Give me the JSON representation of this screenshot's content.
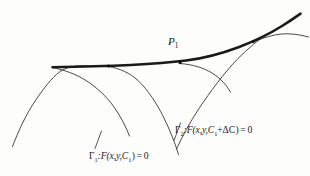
{
  "figure": {
    "background_color": "#fdfdfc",
    "ink_color": "#1a1a1a",
    "width": 310,
    "height": 176
  },
  "labels": {
    "point_p1": "P₁",
    "point_p1_base": "P",
    "point_p1_sub": "1",
    "gamma1": "Γ₁:F(x,y,C₁) = 0",
    "gamma1_name": "Γ",
    "gamma1_sub": "1",
    "gamma1_expr": ":F(x,y,C",
    "gamma1_param_sub": "1",
    "gamma1_tail": ") = 0",
    "gamma2_name": "Γ",
    "gamma2_sub": "2",
    "gamma2_expr": ":F(x,y,C",
    "gamma2_param_sub": "1",
    "gamma2_delta": "+ΔC",
    "gamma2_tail": ") = 0",
    "gamma2": "Γ₂:F(x,y,C₁+ΔC) = 0"
  },
  "geometry": {
    "envelope": {
      "name": "envelope-curve",
      "stroke_width": 2.6,
      "path": "M 52.5 67.2 C 96 66.6 150 65.0 186 60.5 C 222 56.0 258 41.0 282 26.0 C 291 20.4 296 16.8 300.5 13.6"
    },
    "family_curves": [
      {
        "name": "family-curve-left",
        "path": "M 12.5 146.5 C 18 132 26 114 36.5 99 C 44 88.2 51 78.5 59.5 72.0 C 66 67.0 76 65.0 88 66.0"
      },
      {
        "name": "gamma1-curve",
        "path": "M 108.5 66.5 C 120 68.5 130 73 138 80.5 C 148 90 157 104 163 116 C 170 130 175 143 178.5 154.5"
      },
      {
        "name": "family-curve-mid-left",
        "path": "M 52.5 67.5 C 64 70.0 76 74.0 86 80.5 C 97 87.5 107 97 114 107 C 121 117 126 127 129.5 136.0"
      },
      {
        "name": "gamma2-curve",
        "path": "M 176.5 149.0 C 182 137 190 122 199 108.5 C 210 92 224 73 238 58.5 C 248 48.5 258 40.0 268 33.5"
      },
      {
        "name": "family-curve-arc-p1",
        "path": "M 180.0 63.5 C 193 64.5 204 68.0 212 73.0 C 221 78.5 227 86 230.5 92.0"
      },
      {
        "name": "family-curve-right",
        "path": "M 253.5 42.0 C 266 36.5 278 33.5 288 33.8 C 296 34.1 303 35.5 308.5 37.0"
      }
    ],
    "tangent_points": [
      {
        "name": "tangent-point-left",
        "x": 108.5,
        "y": 66.0,
        "r": 1.5
      },
      {
        "name": "tangent-point-p1",
        "x": 180.0,
        "y": 62.6,
        "r": 1.6
      },
      {
        "name": "tangent-point-right",
        "x": 253.2,
        "y": 41.6,
        "r": 1.5
      }
    ],
    "leader_lines": [
      {
        "name": "leader-line-gamma1",
        "x1": 101.5,
        "y1": 131.0,
        "x2": 95.0,
        "y2": 148.5
      },
      {
        "name": "leader-line-gamma2",
        "x1": 180.5,
        "y1": 123.0,
        "x2": 174.0,
        "y2": 140.5
      }
    ]
  }
}
